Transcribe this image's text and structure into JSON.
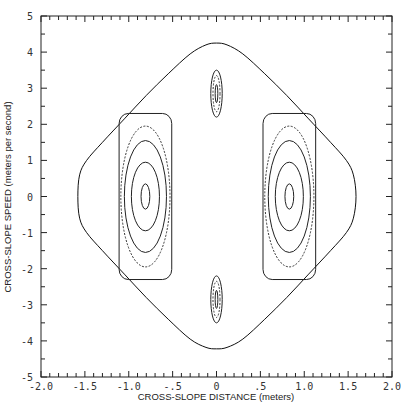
{
  "chart_data": {
    "type": "line",
    "subtype": "phase-portrait",
    "title": "",
    "xlabel": "CROSS-SLOPE DISTANCE (meters)",
    "ylabel": "CROSS-SLOPE SPEED (meters per second)",
    "xlim": [
      -2.0,
      2.0
    ],
    "ylim": [
      -5,
      5
    ],
    "x_tick_labels": [
      "-2.0",
      "-1.5",
      "-1.0",
      "-.5",
      "0",
      ".5",
      "1.0",
      "1.5",
      "2.0"
    ],
    "x_tick_values": [
      -2.0,
      -1.5,
      -1.0,
      -0.5,
      0,
      0.5,
      1.0,
      1.5,
      2.0
    ],
    "x_minor_tick_step": 0.1,
    "y_tick_labels": [
      "-5",
      "-4",
      "-3",
      "-2",
      "-1",
      "0",
      "1",
      "2",
      "3",
      "4",
      "5"
    ],
    "y_tick_values": [
      -5,
      -4,
      -3,
      -2,
      -1,
      0,
      1,
      2,
      3,
      4,
      5
    ],
    "y_minor_tick_step": 0.5,
    "grid": false,
    "legend": null,
    "series": [
      {
        "name": "outer separatrix",
        "shape": "rounded diamond",
        "x_extent": [
          -1.58,
          1.59
        ],
        "y_extent": [
          -4.22,
          4.25
        ],
        "points": [
          [
            1.59,
            0
          ],
          [
            1.56,
            0.6
          ],
          [
            1.48,
            1.0
          ],
          [
            1.3,
            1.5
          ],
          [
            1.05,
            2.15
          ],
          [
            0.8,
            2.8
          ],
          [
            0.55,
            3.4
          ],
          [
            0.3,
            3.95
          ],
          [
            0.12,
            4.2
          ],
          [
            0,
            4.25
          ],
          [
            -0.12,
            4.2
          ],
          [
            -0.3,
            3.95
          ],
          [
            -0.55,
            3.4
          ],
          [
            -0.8,
            2.8
          ],
          [
            -1.05,
            2.15
          ],
          [
            -1.3,
            1.5
          ],
          [
            -1.48,
            1.0
          ],
          [
            -1.56,
            0.6
          ],
          [
            -1.58,
            0
          ],
          [
            -1.56,
            -0.6
          ],
          [
            -1.48,
            -1.0
          ],
          [
            -1.3,
            -1.5
          ],
          [
            -1.05,
            -2.15
          ],
          [
            -0.8,
            -2.8
          ],
          [
            -0.55,
            -3.4
          ],
          [
            -0.3,
            -3.95
          ],
          [
            -0.12,
            -4.18
          ],
          [
            0,
            -4.22
          ],
          [
            0.12,
            -4.18
          ],
          [
            0.3,
            -3.95
          ],
          [
            0.55,
            -3.4
          ],
          [
            0.8,
            -2.8
          ],
          [
            1.05,
            -2.15
          ],
          [
            1.3,
            -1.5
          ],
          [
            1.48,
            -1.0
          ],
          [
            1.56,
            -0.6
          ]
        ]
      },
      {
        "name": "left island",
        "center": [
          -0.81,
          0.0
        ],
        "orbits": [
          {
            "rx": 0.05,
            "ry": 0.35,
            "style": "solid"
          },
          {
            "rx": 0.16,
            "ry": 0.95,
            "style": "solid"
          },
          {
            "rx": 0.24,
            "ry": 1.55,
            "style": "solid"
          },
          {
            "rx": 0.28,
            "ry": 1.95,
            "style": "dotted"
          },
          {
            "rx": 0.3,
            "ry": 2.3,
            "style": "solid-boxy"
          }
        ]
      },
      {
        "name": "right island",
        "center": [
          0.83,
          0.0
        ],
        "orbits": [
          {
            "rx": 0.05,
            "ry": 0.35,
            "style": "solid"
          },
          {
            "rx": 0.16,
            "ry": 0.95,
            "style": "solid"
          },
          {
            "rx": 0.24,
            "ry": 1.55,
            "style": "solid"
          },
          {
            "rx": 0.28,
            "ry": 1.95,
            "style": "dotted"
          },
          {
            "rx": 0.3,
            "ry": 2.3,
            "style": "solid-boxy"
          }
        ]
      },
      {
        "name": "top island",
        "center": [
          0.0,
          2.85
        ],
        "orbits": [
          {
            "rx": 0.015,
            "ry": 0.25,
            "style": "solid"
          },
          {
            "rx": 0.04,
            "ry": 0.5,
            "style": "dotted"
          },
          {
            "rx": 0.065,
            "ry": 0.65,
            "style": "solid"
          }
        ]
      },
      {
        "name": "bottom island",
        "center": [
          0.0,
          -2.85
        ],
        "orbits": [
          {
            "rx": 0.015,
            "ry": 0.25,
            "style": "solid"
          },
          {
            "rx": 0.04,
            "ry": 0.5,
            "style": "dotted"
          },
          {
            "rx": 0.065,
            "ry": 0.65,
            "style": "solid"
          }
        ]
      }
    ]
  },
  "layout": {
    "plot_left": 41,
    "plot_right": 392,
    "plot_top": 16,
    "plot_bottom": 377
  }
}
